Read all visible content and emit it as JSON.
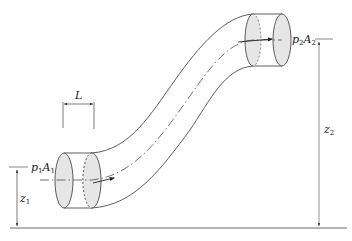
{
  "diagram": {
    "type": "pipe-flow-control-volume",
    "colors": {
      "line": "#333333",
      "face_fill": "#e6e6e6",
      "background": "#ffffff",
      "dimension_line": "#555555"
    },
    "labels": {
      "length": "L",
      "inlet_pressure_var": "p",
      "inlet_pressure_sub": "1",
      "inlet_area_var": "A",
      "inlet_area_sub": "1",
      "outlet_pressure_var": "p",
      "outlet_pressure_sub": "2",
      "outlet_area_var": "A",
      "outlet_area_sub": "2",
      "inlet_height_var": "z",
      "inlet_height_sub": "1",
      "outlet_height_var": "z",
      "outlet_height_sub": "2"
    },
    "elements": [
      {
        "name": "pipe",
        "description": "S-shaped curved pipe rising from lower-left to upper-right"
      },
      {
        "name": "inlet-section",
        "description": "Cylindrical slice of length L at inlet with shaded end faces"
      },
      {
        "name": "outlet-section",
        "description": "Cylindrical slice at outlet with shaded end faces"
      },
      {
        "name": "centerline",
        "description": "Dash-dot centerline with flow direction arrows"
      },
      {
        "name": "datum-line",
        "description": "Horizontal reference ground line"
      },
      {
        "name": "z1-dimension",
        "description": "Vertical height of inlet above datum"
      },
      {
        "name": "z2-dimension",
        "description": "Vertical height of outlet above datum"
      }
    ]
  }
}
